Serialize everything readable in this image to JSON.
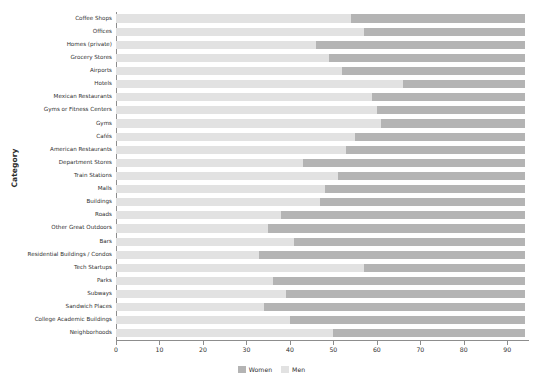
{
  "chart_data": {
    "type": "bar",
    "orientation": "horizontal",
    "stacked": true,
    "title": "",
    "xlabel": "",
    "ylabel": "Category",
    "xlim": [
      0,
      95
    ],
    "xticks": [
      0,
      10,
      20,
      30,
      40,
      50,
      60,
      70,
      80,
      90
    ],
    "grid": false,
    "legend_position": "bottom",
    "categories": [
      "Coffee Shops",
      "Offices",
      "Homes (private)",
      "Grocery Stores",
      "Airports",
      "Hotels",
      "Mexican Restaurants",
      "Gyms or Fitness Centers",
      "Gyms",
      "Cafés",
      "American Restaurants",
      "Department Stores",
      "Train Stations",
      "Malls",
      "Buildings",
      "Roads",
      "Other Great Outdoors",
      "Bars",
      "Residential Buildings / Condos",
      "Tech Startups",
      "Parks",
      "Subways",
      "Sandwich Places",
      "College Academic Buildings",
      "Neighborhoods"
    ],
    "series": [
      {
        "name": "Men",
        "color": "#e2e2e2",
        "values": [
          54,
          57,
          46,
          49,
          52,
          66,
          59,
          60,
          61,
          55,
          53,
          43,
          51,
          48,
          47,
          38,
          35,
          41,
          33,
          57,
          36,
          39,
          34,
          40,
          50
        ]
      },
      {
        "name": "Women",
        "color": "#b4b4b4",
        "values": [
          40,
          37,
          48,
          45,
          42,
          28,
          35,
          34,
          33,
          39,
          41,
          51,
          43,
          46,
          47,
          56,
          59,
          53,
          61,
          37,
          58,
          55,
          60,
          54,
          44
        ]
      }
    ],
    "totals": [
      94,
      94,
      94,
      94,
      94,
      94,
      94,
      94,
      94,
      94,
      94,
      94,
      94,
      94,
      94,
      94,
      94,
      94,
      94,
      94,
      94,
      94,
      94,
      94,
      94
    ]
  },
  "legend": {
    "items": [
      {
        "label": "Women",
        "swatch": "women"
      },
      {
        "label": "Men",
        "swatch": "men"
      }
    ]
  }
}
